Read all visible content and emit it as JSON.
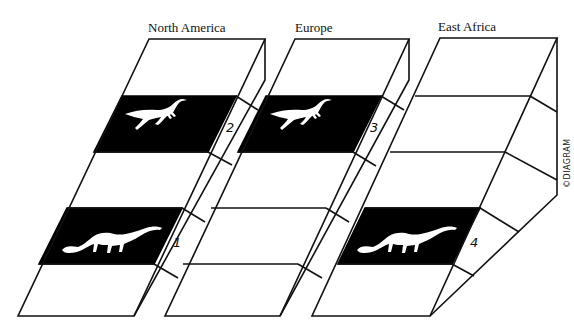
{
  "diagram": {
    "columns": [
      {
        "label": "North America",
        "bands": [
          {
            "number": "2",
            "fossil": "small theropod-like dinosaur",
            "row": 1
          },
          {
            "number": "1",
            "fossil": "sauropod dinosaur",
            "row": 3
          }
        ]
      },
      {
        "label": "Europe",
        "bands": [
          {
            "number": "3",
            "fossil": "small theropod-like dinosaur",
            "row": 1
          }
        ]
      },
      {
        "label": "East Africa",
        "bands": [
          {
            "number": "4",
            "fossil": "sauropod dinosaur",
            "row": 3
          }
        ]
      }
    ],
    "credit": "©DIAGRAM",
    "colors": {
      "ink": "#111111",
      "band": "#000000",
      "paper": "#ffffff"
    }
  }
}
